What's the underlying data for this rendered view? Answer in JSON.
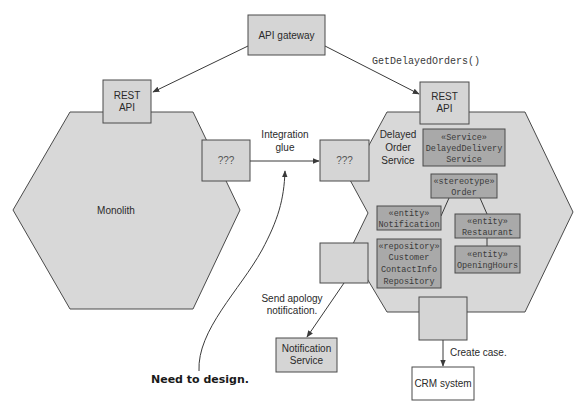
{
  "colors": {
    "hexagon_fill": "#d8d8d8",
    "box_fill": "#d5d5d5",
    "component_fill": "#a9a9a9",
    "stroke": "#4a4a4a"
  },
  "api_gateway": {
    "label": "API gateway"
  },
  "call_label": "GetDelayedOrders()",
  "monolith": {
    "label": "Monolith",
    "rest_api": {
      "line1": "REST",
      "line2": "API"
    },
    "adapter": {
      "label": "???"
    }
  },
  "integration_glue": {
    "line1": "Integration",
    "line2": "glue"
  },
  "service": {
    "name": {
      "line1": "Delayed",
      "line2": "Order",
      "line3": "Service"
    },
    "rest_api": {
      "line1": "REST",
      "line2": "API"
    },
    "adapter": {
      "label": "???"
    },
    "components": [
      {
        "stereotype": "«Service»",
        "line1": "DelayedDelivery",
        "line2": "Service"
      },
      {
        "stereotype": "«stereotype»",
        "line1": "Order"
      },
      {
        "stereotype": "«entity»",
        "line1": "Notification"
      },
      {
        "stereotype": "«entity»",
        "line1": "Restaurant"
      },
      {
        "stereotype": "«entity»",
        "line1": "OpeningHours"
      },
      {
        "stereotype": "«repository»",
        "line1": "Customer",
        "line2": "ContactInfo",
        "line3": "Repository"
      }
    ]
  },
  "send_apology": {
    "line1": "Send apology",
    "line2": "notification."
  },
  "notification_service": {
    "line1": "Notification",
    "line2": "Service"
  },
  "create_case": {
    "label": "Create case."
  },
  "crm_system": {
    "label": "CRM system"
  },
  "annotation": {
    "label": "Need to design."
  }
}
